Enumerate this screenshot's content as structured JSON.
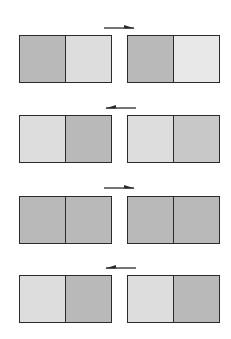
{
  "diagram": {
    "colors": {
      "dark": "#b9b9b9",
      "medium": "#c8c8c8",
      "light": "#dddddd",
      "lighter": "#e8e8e8",
      "border": "#2a2a2a",
      "arrow": "#2a2a2a"
    },
    "rows": [
      {
        "arrow": "right",
        "arrow_y": 23,
        "box_y": 35,
        "left": [
          "dark",
          "light"
        ],
        "right": [
          "dark",
          "lighter"
        ]
      },
      {
        "arrow": "left",
        "arrow_y": 103,
        "box_y": 115,
        "left": [
          "light",
          "dark"
        ],
        "right": [
          "light",
          "medium"
        ]
      },
      {
        "arrow": "right",
        "arrow_y": 183,
        "box_y": 196,
        "left": [
          "dark",
          "dark"
        ],
        "right": [
          "dark",
          "dark"
        ]
      },
      {
        "arrow": "left",
        "arrow_y": 263,
        "box_y": 275,
        "left": [
          "light",
          "dark"
        ],
        "right": [
          "light",
          "dark"
        ]
      }
    ]
  }
}
